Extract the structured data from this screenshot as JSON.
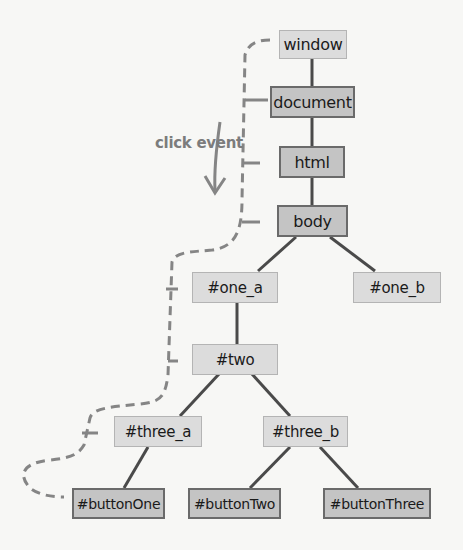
{
  "diagram": {
    "type": "DOM event propagation tree",
    "annotation": "click event",
    "colors": {
      "background": "#f7f7f5",
      "light_node_fill": "#dcdcdc",
      "dark_node_fill": "#c4c4c4",
      "edge": "#4a4a4a",
      "event_path": "#858585"
    },
    "nodes": {
      "window": "window",
      "document": "document",
      "html": "html",
      "body": "body",
      "one_a": "#one_a",
      "one_b": "#one_b",
      "two": "#two",
      "three_a": "#three_a",
      "three_b": "#three_b",
      "buttonOne": "#buttonOne",
      "buttonTwo": "#buttonTwo",
      "buttonThree": "#buttonThree"
    },
    "edges": [
      [
        "window",
        "document"
      ],
      [
        "document",
        "html"
      ],
      [
        "html",
        "body"
      ],
      [
        "body",
        "one_a"
      ],
      [
        "body",
        "one_b"
      ],
      [
        "one_a",
        "two"
      ],
      [
        "two",
        "three_a"
      ],
      [
        "two",
        "three_b"
      ],
      [
        "three_a",
        "buttonOne"
      ],
      [
        "three_b",
        "buttonTwo"
      ],
      [
        "three_b",
        "buttonThree"
      ]
    ],
    "event_path": [
      "window",
      "document",
      "html",
      "body",
      "one_a",
      "two",
      "three_a",
      "buttonOne"
    ]
  }
}
